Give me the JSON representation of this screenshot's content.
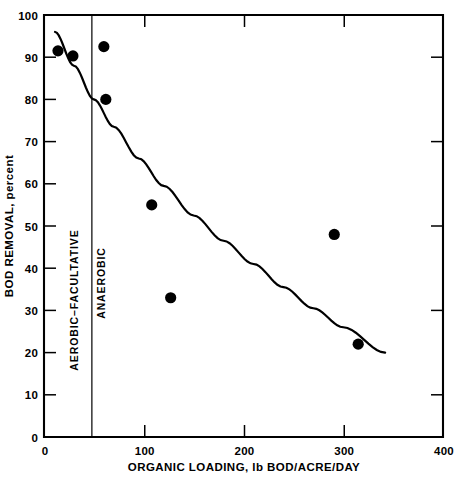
{
  "chart_data": {
    "type": "scatter",
    "title": "",
    "xlabel": "ORGANIC LOADING,  lb BOD/ACRE/DAY",
    "ylabel": "BOD REMOVAL, percent",
    "xlim": [
      0,
      400
    ],
    "ylim": [
      0,
      100
    ],
    "grid": false,
    "legend": "none",
    "x_ticks": [
      0,
      100,
      200,
      300,
      400
    ],
    "x_tick_labels": [
      "0",
      "100",
      "200",
      "300",
      "400"
    ],
    "y_ticks": [
      0,
      10,
      20,
      30,
      40,
      50,
      60,
      70,
      80,
      90,
      100
    ],
    "y_tick_labels": [
      "0",
      "10",
      "20",
      "30",
      "40",
      "50",
      "60",
      "70",
      "80",
      "90",
      "100"
    ],
    "points": [
      {
        "x": 14,
        "y": 91.5
      },
      {
        "x": 29,
        "y": 90.3
      },
      {
        "x": 60,
        "y": 92.5
      },
      {
        "x": 62,
        "y": 80.0
      },
      {
        "x": 108,
        "y": 55.0
      },
      {
        "x": 127,
        "y": 33.0
      },
      {
        "x": 291,
        "y": 48.0
      },
      {
        "x": 315,
        "y": 22.0
      }
    ],
    "series": [
      {
        "name": "fitted trend curve",
        "type": "line",
        "x": [
          11,
          30,
          50,
          70,
          95,
          120,
          150,
          180,
          210,
          240,
          270,
          300,
          342
        ],
        "y": [
          96.0,
          88.0,
          80.0,
          73.5,
          66.0,
          59.5,
          52.5,
          46.5,
          41.0,
          35.5,
          30.5,
          26.0,
          20.0
        ]
      }
    ],
    "annotations": [
      {
        "name": "divider",
        "type": "vline",
        "x": 48
      },
      {
        "name": "region-left",
        "text": "AEROBIC–FACULTATIVE",
        "x": 30,
        "orientation": "vertical"
      },
      {
        "name": "region-right",
        "text": "ANAEROBIC",
        "x": 62,
        "orientation": "vertical"
      }
    ]
  },
  "axes": {
    "y_title": "BOD REMOVAL, percent",
    "x_title": "ORGANIC LOADING,  lb BOD/ACRE/DAY",
    "y_labels": [
      "100",
      "90",
      "80",
      "70",
      "60",
      "50",
      "40",
      "30",
      "20",
      "10",
      "0"
    ],
    "x_labels": [
      "0",
      "100",
      "200",
      "300",
      "400"
    ]
  },
  "regions": {
    "left_label": "AEROBIC–FACULTATIVE",
    "right_label": "ANAEROBIC"
  },
  "colors": {
    "ink": "#000000",
    "background": "#ffffff"
  }
}
